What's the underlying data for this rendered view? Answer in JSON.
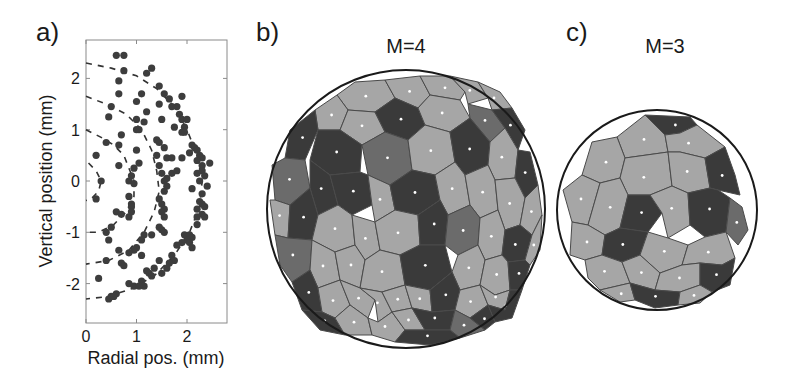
{
  "panels": {
    "a": {
      "label": "a)"
    },
    "b": {
      "label": "b)",
      "title": "M=4"
    },
    "c": {
      "label": "c)",
      "title": "M=3"
    }
  },
  "colors": {
    "light_cell": "#a6a6a6",
    "medium_cell": "#6b6b6b",
    "dark_cell": "#3a3a3a",
    "edge": "#4a4a4a",
    "marker": "#3d3d3d",
    "circle": "#1a1a1a"
  },
  "chart_data": [
    {
      "type": "scatter",
      "panel": "a)",
      "title": "",
      "xlabel": "Radial pos. (mm)",
      "ylabel": "Vertical position (mm)",
      "xlim": [
        0,
        2.8
      ],
      "ylim": [
        -2.75,
        2.75
      ],
      "xticks": [
        0,
        1,
        2
      ],
      "yticks": [
        -2,
        -1,
        0,
        1,
        2
      ],
      "grid": false,
      "legend": null,
      "dashed_arcs": [
        {
          "name": "shell-1",
          "points": [
            [
              0.05,
              0.35
            ],
            [
              0.2,
              0.2
            ],
            [
              0.3,
              0.0
            ],
            [
              0.25,
              -0.2
            ],
            [
              0.1,
              -0.35
            ],
            [
              0.0,
              -0.38
            ]
          ]
        },
        {
          "name": "shell-2",
          "points": [
            [
              0.0,
              1.0
            ],
            [
              0.3,
              0.85
            ],
            [
              0.55,
              0.7
            ],
            [
              0.75,
              0.5
            ],
            [
              0.85,
              0.25
            ],
            [
              0.95,
              0.0
            ],
            [
              0.95,
              -0.3
            ],
            [
              0.8,
              -0.6
            ],
            [
              0.55,
              -0.85
            ],
            [
              0.25,
              -1.0
            ],
            [
              0.0,
              -1.0
            ]
          ]
        },
        {
          "name": "shell-3",
          "points": [
            [
              0.0,
              1.65
            ],
            [
              0.4,
              1.5
            ],
            [
              0.8,
              1.3
            ],
            [
              1.1,
              1.0
            ],
            [
              1.3,
              0.6
            ],
            [
              1.4,
              0.2
            ],
            [
              1.45,
              -0.2
            ],
            [
              1.35,
              -0.6
            ],
            [
              1.15,
              -1.0
            ],
            [
              0.85,
              -1.35
            ],
            [
              0.45,
              -1.55
            ],
            [
              0.0,
              -1.62
            ]
          ]
        },
        {
          "name": "shell-4",
          "points": [
            [
              0.0,
              2.3
            ],
            [
              0.5,
              2.2
            ],
            [
              1.0,
              2.05
            ],
            [
              1.4,
              1.8
            ],
            [
              1.75,
              1.45
            ],
            [
              2.0,
              1.0
            ],
            [
              2.2,
              0.5
            ],
            [
              2.3,
              0.0
            ],
            [
              2.25,
              -0.5
            ],
            [
              2.05,
              -1.0
            ],
            [
              1.75,
              -1.45
            ],
            [
              1.35,
              -1.85
            ],
            [
              0.9,
              -2.1
            ],
            [
              0.45,
              -2.25
            ],
            [
              0.0,
              -2.3
            ]
          ]
        }
      ],
      "series": [
        {
          "name": "particles",
          "points": [
            [
              0.6,
              2.45
            ],
            [
              0.75,
              2.45
            ],
            [
              0.75,
              2.15
            ],
            [
              1.3,
              2.2
            ],
            [
              1.2,
              2.1
            ],
            [
              0.65,
              1.95
            ],
            [
              0.65,
              1.7
            ],
            [
              1.45,
              1.85
            ],
            [
              1.55,
              1.7
            ],
            [
              1.65,
              1.6
            ],
            [
              1.9,
              1.65
            ],
            [
              1.8,
              1.45
            ],
            [
              1.7,
              1.45
            ],
            [
              0.5,
              1.45
            ],
            [
              0.45,
              1.25
            ],
            [
              1.1,
              1.7
            ],
            [
              1.0,
              1.55
            ],
            [
              1.45,
              1.5
            ],
            [
              1.2,
              1.35
            ],
            [
              1.0,
              1.2
            ],
            [
              1.15,
              1.15
            ],
            [
              1.5,
              1.2
            ],
            [
              1.85,
              1.3
            ],
            [
              1.9,
              1.2
            ],
            [
              2.0,
              1.2
            ],
            [
              1.75,
              1.05
            ],
            [
              1.95,
              1.05
            ],
            [
              1.9,
              0.95
            ],
            [
              1.95,
              0.95
            ],
            [
              0.7,
              0.9
            ],
            [
              1.0,
              1.0
            ],
            [
              1.05,
              1.0
            ],
            [
              0.4,
              0.75
            ],
            [
              0.65,
              0.7
            ],
            [
              1.0,
              0.6
            ],
            [
              1.4,
              0.8
            ],
            [
              1.45,
              0.75
            ],
            [
              1.55,
              0.65
            ],
            [
              2.1,
              0.7
            ],
            [
              2.15,
              0.65
            ],
            [
              2.2,
              0.6
            ],
            [
              2.05,
              0.55
            ],
            [
              2.25,
              0.5
            ],
            [
              2.3,
              0.45
            ],
            [
              0.2,
              0.5
            ],
            [
              0.65,
              0.3
            ],
            [
              1.05,
              0.35
            ],
            [
              1.4,
              0.5
            ],
            [
              1.6,
              0.45
            ],
            [
              1.7,
              0.45
            ],
            [
              1.9,
              0.45
            ],
            [
              2.2,
              0.4
            ],
            [
              2.45,
              0.35
            ],
            [
              2.3,
              0.3
            ],
            [
              0.3,
              0.0
            ],
            [
              0.95,
              0.25
            ],
            [
              0.9,
              0.1
            ],
            [
              0.85,
              0.0
            ],
            [
              0.95,
              -0.05
            ],
            [
              1.45,
              0.3
            ],
            [
              1.5,
              0.15
            ],
            [
              1.55,
              0.0
            ],
            [
              1.6,
              0.05
            ],
            [
              1.7,
              0.15
            ],
            [
              1.8,
              0.2
            ],
            [
              2.2,
              0.15
            ],
            [
              2.3,
              0.2
            ],
            [
              2.35,
              0.1
            ],
            [
              2.25,
              0.0
            ],
            [
              2.4,
              -0.1
            ],
            [
              1.55,
              -0.2
            ],
            [
              1.6,
              -0.1
            ],
            [
              2.1,
              -0.15
            ],
            [
              2.3,
              -0.25
            ],
            [
              0.2,
              -0.35
            ],
            [
              0.85,
              -0.3
            ],
            [
              0.9,
              -0.45
            ],
            [
              0.9,
              -0.5
            ],
            [
              1.45,
              -0.35
            ],
            [
              1.5,
              -0.45
            ],
            [
              1.55,
              -0.55
            ],
            [
              1.5,
              -0.6
            ],
            [
              2.25,
              -0.4
            ],
            [
              2.3,
              -0.45
            ],
            [
              2.35,
              -0.5
            ],
            [
              2.2,
              -0.55
            ],
            [
              2.3,
              -0.65
            ],
            [
              0.6,
              -0.6
            ],
            [
              0.7,
              -0.65
            ],
            [
              0.85,
              -0.7
            ],
            [
              0.9,
              -0.6
            ],
            [
              1.55,
              -0.7
            ],
            [
              2.2,
              -0.7
            ],
            [
              2.35,
              -0.7
            ],
            [
              2.2,
              -0.85
            ],
            [
              0.5,
              -0.9
            ],
            [
              1.45,
              -0.9
            ],
            [
              1.5,
              -0.95
            ],
            [
              1.55,
              -1.0
            ],
            [
              0.4,
              -1.0
            ],
            [
              0.45,
              -1.15
            ],
            [
              1.3,
              -1.05
            ],
            [
              1.15,
              -1.05
            ],
            [
              1.1,
              -1.15
            ],
            [
              1.95,
              -1.05
            ],
            [
              2.05,
              -1.05
            ],
            [
              2.1,
              -1.1
            ],
            [
              2.0,
              -1.15
            ],
            [
              1.9,
              -1.2
            ],
            [
              2.05,
              -1.2
            ],
            [
              2.1,
              -1.3
            ],
            [
              1.8,
              -1.25
            ],
            [
              1.0,
              -1.3
            ],
            [
              0.95,
              -1.35
            ],
            [
              1.1,
              -1.45
            ],
            [
              0.65,
              -1.35
            ],
            [
              0.85,
              -1.4
            ],
            [
              0.4,
              -1.55
            ],
            [
              0.7,
              -1.6
            ],
            [
              0.75,
              -1.65
            ],
            [
              1.7,
              -1.45
            ],
            [
              1.75,
              -1.55
            ],
            [
              1.65,
              -1.6
            ],
            [
              1.6,
              -1.7
            ],
            [
              1.45,
              -1.55
            ],
            [
              1.35,
              -1.7
            ],
            [
              1.2,
              -1.75
            ],
            [
              1.25,
              -1.8
            ],
            [
              1.5,
              -1.8
            ],
            [
              1.3,
              -1.85
            ],
            [
              0.25,
              -1.9
            ],
            [
              0.85,
              -2.0
            ],
            [
              0.95,
              -2.05
            ],
            [
              1.1,
              -1.95
            ],
            [
              1.15,
              -2.05
            ],
            [
              1.05,
              -2.05
            ],
            [
              0.6,
              -2.2
            ],
            [
              0.5,
              -2.25
            ],
            [
              0.45,
              -2.3
            ],
            [
              0.55,
              -2.25
            ]
          ]
        }
      ]
    },
    {
      "type": "heatmap",
      "panel": "b)",
      "title": "M=4",
      "description": "Voronoi tessellation of particles on a spherical cap; cells shaded by coordination (light, medium, dark)",
      "shade_counts": {
        "light": 38,
        "medium": 8,
        "dark": 19
      }
    },
    {
      "type": "heatmap",
      "panel": "c)",
      "title": "M=3",
      "description": "Voronoi tessellation of particles on a spherical cap; cells shaded by coordination (light, medium, dark)",
      "shade_counts": {
        "light": 18,
        "medium": 1,
        "dark": 8
      }
    }
  ]
}
